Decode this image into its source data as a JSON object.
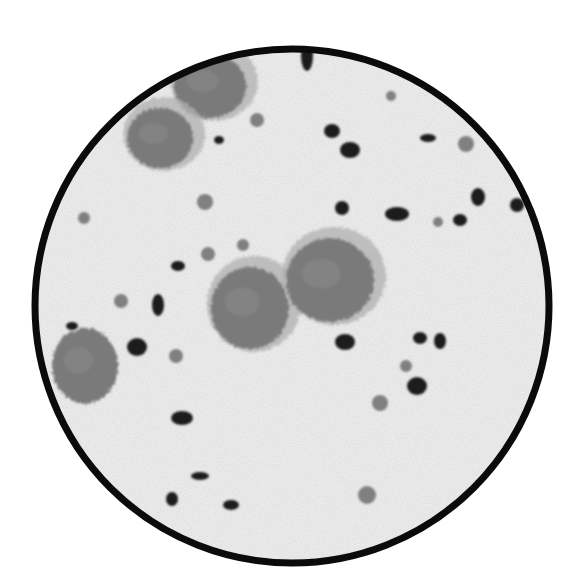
{
  "image": {
    "description": "Black-and-white micrograph: circular microscope field of view showing large epithelial cells and scattered small dark nuclei and cocci",
    "colors": {
      "background": "#ffffff",
      "field": "#f2f2f2",
      "ring": "#0b0b0b",
      "large_cell": "#7a7a7a",
      "large_cell_halo": "#b0b0b0",
      "dark_nucleus": "#1e1e1e",
      "gray_cell": "#6e6e6e"
    },
    "field": {
      "cx": 292,
      "cy": 306,
      "r": 257,
      "ring_width": 7
    },
    "large_cells": [
      {
        "cx": 210,
        "cy": 86,
        "rx": 36,
        "ry": 32,
        "halo": true
      },
      {
        "cx": 160,
        "cy": 138,
        "rx": 33,
        "ry": 30,
        "halo": true
      },
      {
        "cx": 250,
        "cy": 308,
        "rx": 39,
        "ry": 41,
        "halo": true
      },
      {
        "cx": 330,
        "cy": 280,
        "rx": 44,
        "ry": 42,
        "halo": true
      },
      {
        "cx": 85,
        "cy": 366,
        "rx": 33,
        "ry": 38,
        "halo": false
      }
    ],
    "small_gray_cells": [
      {
        "cx": 257,
        "cy": 120,
        "r": 7
      },
      {
        "cx": 205,
        "cy": 202,
        "r": 8
      },
      {
        "cx": 84,
        "cy": 218,
        "r": 6
      },
      {
        "cx": 208,
        "cy": 254,
        "r": 7
      },
      {
        "cx": 243,
        "cy": 245,
        "r": 6
      },
      {
        "cx": 466,
        "cy": 144,
        "r": 8
      },
      {
        "cx": 121,
        "cy": 301,
        "r": 7
      },
      {
        "cx": 176,
        "cy": 356,
        "r": 7
      },
      {
        "cx": 380,
        "cy": 403,
        "r": 8
      },
      {
        "cx": 406,
        "cy": 366,
        "r": 6
      },
      {
        "cx": 367,
        "cy": 495,
        "r": 9
      },
      {
        "cx": 438,
        "cy": 222,
        "r": 5
      },
      {
        "cx": 391,
        "cy": 96,
        "r": 5
      }
    ],
    "dark_nuclei": [
      {
        "cx": 219,
        "cy": 140,
        "rx": 5,
        "ry": 4
      },
      {
        "cx": 307,
        "cy": 56,
        "rx": 6,
        "ry": 15
      },
      {
        "cx": 332,
        "cy": 131,
        "rx": 8,
        "ry": 7
      },
      {
        "cx": 350,
        "cy": 150,
        "rx": 10,
        "ry": 8
      },
      {
        "cx": 428,
        "cy": 138,
        "rx": 8,
        "ry": 4
      },
      {
        "cx": 478,
        "cy": 197,
        "rx": 7,
        "ry": 9
      },
      {
        "cx": 517,
        "cy": 205,
        "rx": 7,
        "ry": 7
      },
      {
        "cx": 342,
        "cy": 208,
        "rx": 7,
        "ry": 7
      },
      {
        "cx": 397,
        "cy": 214,
        "rx": 12,
        "ry": 7
      },
      {
        "cx": 460,
        "cy": 220,
        "rx": 7,
        "ry": 6
      },
      {
        "cx": 178,
        "cy": 266,
        "rx": 7,
        "ry": 5
      },
      {
        "cx": 158,
        "cy": 305,
        "rx": 6,
        "ry": 11
      },
      {
        "cx": 137,
        "cy": 347,
        "rx": 10,
        "ry": 9
      },
      {
        "cx": 345,
        "cy": 342,
        "rx": 10,
        "ry": 8
      },
      {
        "cx": 420,
        "cy": 338,
        "rx": 7,
        "ry": 6
      },
      {
        "cx": 440,
        "cy": 341,
        "rx": 6,
        "ry": 8
      },
      {
        "cx": 417,
        "cy": 386,
        "rx": 10,
        "ry": 9
      },
      {
        "cx": 182,
        "cy": 418,
        "rx": 11,
        "ry": 7
      },
      {
        "cx": 200,
        "cy": 476,
        "rx": 9,
        "ry": 4
      },
      {
        "cx": 172,
        "cy": 499,
        "rx": 6,
        "ry": 7
      },
      {
        "cx": 231,
        "cy": 505,
        "rx": 8,
        "ry": 5
      },
      {
        "cx": 72,
        "cy": 326,
        "rx": 6,
        "ry": 4
      }
    ]
  }
}
